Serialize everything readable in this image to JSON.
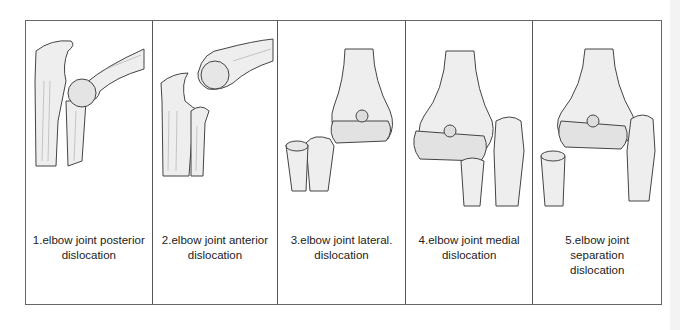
{
  "figure": {
    "panels": [
      {
        "number": "1",
        "caption_line1": "1.elbow joint posterior",
        "caption_line2": "dislocation"
      },
      {
        "number": "2",
        "caption_line1": "2.elbow joint anterior",
        "caption_line2": "dislocation"
      },
      {
        "number": "3",
        "caption_line1": "3.elbow joint lateral.",
        "caption_line2": "dislocation"
      },
      {
        "number": "4",
        "caption_line1": "4.elbow joint medial",
        "caption_line2": "dislocation"
      },
      {
        "number": "5",
        "caption_line1": "5.elbow joint separation",
        "caption_line2": "dislocation"
      }
    ],
    "colors": {
      "border": "#555555",
      "bone_fill": "#eeeeee",
      "bone_stroke": "#444444",
      "text": "#222222"
    }
  }
}
